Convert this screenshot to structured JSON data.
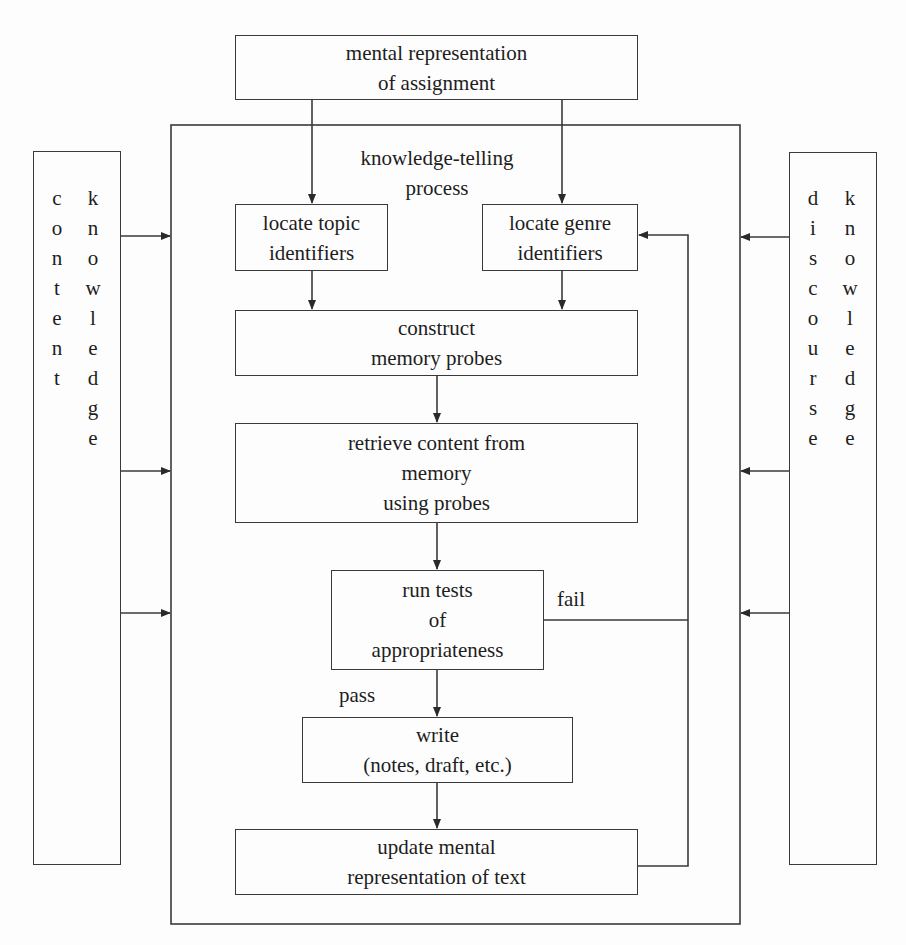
{
  "diagram": {
    "title_box": {
      "line1": "mental representation",
      "line2": "of assignment"
    },
    "process_label": {
      "line1": "knowledge-telling",
      "line2": "process"
    },
    "topic_box": {
      "line1": "locate topic",
      "line2": "identifiers"
    },
    "genre_box": {
      "line1": "locate genre",
      "line2": "identifiers"
    },
    "probes_box": {
      "line1": "construct",
      "line2": "memory probes"
    },
    "retrieve_box": {
      "line1": "retrieve content from",
      "line2": "memory",
      "line3": "using probes"
    },
    "tests_box": {
      "line1": "run tests",
      "line2": "of",
      "line3": "appropriateness"
    },
    "write_box": {
      "line1": "write",
      "line2": "(notes, draft, etc.)"
    },
    "update_box": {
      "line1": "update mental",
      "line2": "representation of text"
    },
    "fail_label": "fail",
    "pass_label": "pass",
    "content_knowledge": {
      "word1": [
        "c",
        "o",
        "n",
        "t",
        "e",
        "n",
        "t"
      ],
      "word2": [
        "k",
        "n",
        "o",
        "w",
        "l",
        "e",
        "d",
        "g",
        "e"
      ]
    },
    "discourse_knowledge": {
      "word1": [
        "d",
        "i",
        "s",
        "c",
        "o",
        "u",
        "r",
        "s",
        "e"
      ],
      "word2": [
        "k",
        "n",
        "o",
        "w",
        "l",
        "e",
        "d",
        "g",
        "e"
      ]
    },
    "line_color": "#3a3a3a"
  }
}
